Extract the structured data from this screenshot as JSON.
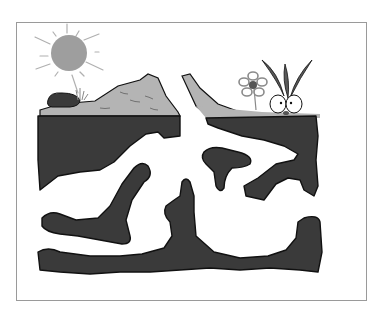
{
  "illustration": {
    "subject": "underground soil cross-section with tunnels",
    "elements": [
      {
        "name": "sun",
        "icon": "sun-icon"
      },
      {
        "name": "rock",
        "icon": "rock-icon"
      },
      {
        "name": "grass-tuft",
        "icon": "grass-icon"
      },
      {
        "name": "hill-left",
        "icon": "hill-icon"
      },
      {
        "name": "hill-right",
        "icon": "hill-icon"
      },
      {
        "name": "flower",
        "icon": "flower-icon"
      },
      {
        "name": "sprouting-bulb",
        "icon": "sprout-icon"
      },
      {
        "name": "soil-layer",
        "icon": "soil-icon"
      }
    ]
  },
  "colors": {
    "background": "#ffffff",
    "frame": "#9a9a9a",
    "sun": "#9e9e9e",
    "sun_rays": "#b0b0b0",
    "hill": "#b4b4b4",
    "soil": "#3a3a3a",
    "outline": "#111111",
    "leaves": "#5a5a5a",
    "flower_center": "#555555"
  }
}
